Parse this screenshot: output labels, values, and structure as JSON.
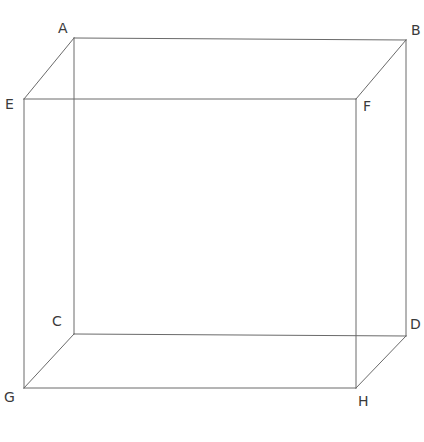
{
  "figure": {
    "name": "cube-wireframe",
    "canvas": {
      "width": 424,
      "height": 442
    },
    "background_color": "#ffffff",
    "line_color": "#6a6a6a",
    "line_width": 1,
    "label_color": "#3a3a3a",
    "label_font_size": 14
  },
  "vertices": [
    {
      "id": "A",
      "label": "A",
      "x": 74,
      "y": 38,
      "label_x": 58,
      "label_y": 21,
      "face": "front"
    },
    {
      "id": "B",
      "label": "B",
      "x": 406,
      "y": 40,
      "label_x": 411,
      "label_y": 23,
      "face": "front"
    },
    {
      "id": "C",
      "label": "C",
      "x": 74,
      "y": 334,
      "label_x": 52,
      "label_y": 314,
      "face": "front"
    },
    {
      "id": "D",
      "label": "D",
      "x": 406,
      "y": 336,
      "label_x": 410,
      "label_y": 317,
      "face": "front"
    },
    {
      "id": "E",
      "label": "E",
      "x": 24,
      "y": 99,
      "label_x": 5,
      "label_y": 97,
      "face": "back"
    },
    {
      "id": "F",
      "label": "F",
      "x": 356,
      "y": 99,
      "label_x": 363,
      "label_y": 99,
      "face": "back"
    },
    {
      "id": "G",
      "label": "G",
      "x": 24,
      "y": 388,
      "label_x": 4,
      "label_y": 390,
      "face": "back"
    },
    {
      "id": "H",
      "label": "H",
      "x": 356,
      "y": 388,
      "label_x": 358,
      "label_y": 394,
      "face": "back"
    }
  ],
  "edges": [
    {
      "id": "AB",
      "from": "A",
      "to": "B",
      "kind": "front-top"
    },
    {
      "id": "AC",
      "from": "A",
      "to": "C",
      "kind": "front-left"
    },
    {
      "id": "BD",
      "from": "B",
      "to": "D",
      "kind": "front-right"
    },
    {
      "id": "CD",
      "from": "C",
      "to": "D",
      "kind": "front-bottom"
    },
    {
      "id": "EF",
      "from": "E",
      "to": "F",
      "kind": "back-top"
    },
    {
      "id": "EG",
      "from": "E",
      "to": "G",
      "kind": "back-left"
    },
    {
      "id": "FH",
      "from": "F",
      "to": "H",
      "kind": "back-right"
    },
    {
      "id": "GH",
      "from": "G",
      "to": "H",
      "kind": "back-bottom"
    },
    {
      "id": "AE",
      "from": "A",
      "to": "E",
      "kind": "depth"
    },
    {
      "id": "BF",
      "from": "B",
      "to": "F",
      "kind": "depth"
    },
    {
      "id": "CG",
      "from": "C",
      "to": "G",
      "kind": "depth"
    },
    {
      "id": "DH",
      "from": "D",
      "to": "H",
      "kind": "depth"
    }
  ]
}
